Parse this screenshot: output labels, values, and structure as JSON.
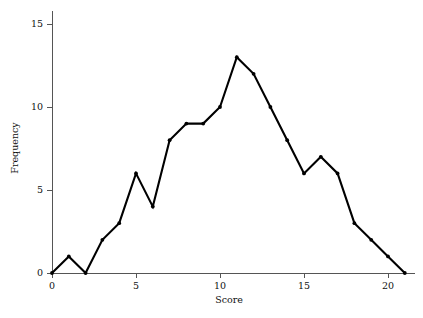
{
  "chart_data": {
    "type": "line",
    "title": "",
    "xlabel": "Score",
    "ylabel": "Frequency",
    "x": [
      0,
      1,
      2,
      3,
      4,
      5,
      6,
      7,
      8,
      9,
      10,
      11,
      12,
      13,
      14,
      15,
      16,
      17,
      18,
      19,
      20,
      21
    ],
    "values": [
      0,
      1,
      0,
      2,
      3,
      6,
      4,
      8,
      9,
      9,
      10,
      13,
      12,
      10,
      8,
      6,
      7,
      6,
      3,
      2,
      1,
      0
    ],
    "series": [
      {
        "name": "Frequency",
        "values": [
          0,
          1,
          0,
          2,
          3,
          6,
          4,
          8,
          9,
          9,
          10,
          13,
          12,
          10,
          8,
          6,
          7,
          6,
          3,
          2,
          1,
          0
        ]
      }
    ],
    "xlim": [
      0,
      21.6
    ],
    "ylim": [
      0,
      15.8
    ],
    "xticks": [
      0,
      5,
      10,
      15,
      20
    ],
    "xtick_labels": [
      "0",
      "5",
      "10",
      "15",
      "20"
    ],
    "yticks": [
      0,
      5,
      10,
      15
    ],
    "ytick_labels": [
      "0",
      "5",
      "10",
      "15"
    ],
    "grid": false,
    "legend": false,
    "legend_position": "none",
    "marker": "filled-circle",
    "line_color": "#000000",
    "marker_color": "#000000",
    "axis_color": "#555555",
    "background_color": "#ffffff"
  },
  "axes": {
    "x_axis_title": "Score",
    "y_axis_title": "Frequency"
  }
}
